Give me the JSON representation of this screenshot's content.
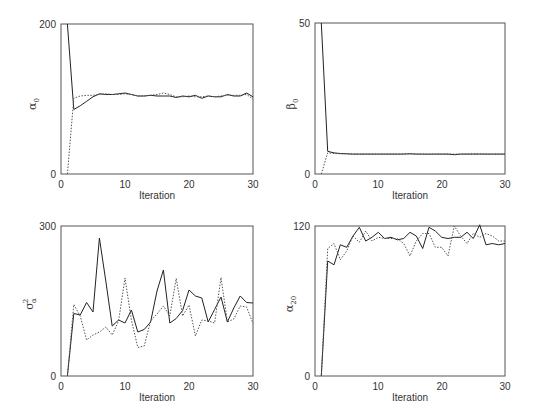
{
  "chart_data": [
    {
      "type": "line",
      "title": "",
      "xlabel": "Iteration",
      "ylabel": "α0",
      "ylabel_main": "α",
      "ylabel_sub": "0",
      "ylabel_sup": "",
      "xlim": [
        0,
        30
      ],
      "ylim": [
        0,
        200
      ],
      "xticks": [
        "0",
        "10",
        "20",
        "30"
      ],
      "yticks": [
        "0",
        "200"
      ],
      "grid": false,
      "x": [
        1,
        2,
        3,
        4,
        5,
        6,
        7,
        8,
        9,
        10,
        11,
        12,
        13,
        14,
        15,
        16,
        17,
        18,
        19,
        20,
        21,
        22,
        23,
        24,
        25,
        26,
        27,
        28,
        29,
        30
      ],
      "series": [
        {
          "name": "chain-solid",
          "style": "solid",
          "values": [
            200,
            86,
            91,
            97,
            103,
            107,
            106,
            106,
            107,
            108,
            106,
            104,
            104,
            105,
            104,
            104,
            104,
            102,
            104,
            103,
            105,
            101,
            104,
            103,
            103,
            106,
            104,
            104,
            108,
            103
          ]
        },
        {
          "name": "chain-dotted",
          "style": "dotted",
          "values": [
            0,
            101,
            104,
            105,
            105,
            106,
            107,
            106,
            106,
            107,
            106,
            104,
            104,
            105,
            106,
            108,
            106,
            103,
            103,
            104,
            103,
            103,
            104,
            103,
            104,
            105,
            105,
            105,
            106,
            100
          ]
        }
      ]
    },
    {
      "type": "line",
      "title": "",
      "xlabel": "Iteration",
      "ylabel": "β0",
      "ylabel_main": "β",
      "ylabel_sub": "0",
      "ylabel_sup": "",
      "xlim": [
        0,
        30
      ],
      "ylim": [
        0,
        50
      ],
      "xticks": [
        "0",
        "10",
        "20",
        "30"
      ],
      "yticks": [
        "0",
        "50"
      ],
      "grid": false,
      "x": [
        1,
        2,
        3,
        4,
        5,
        6,
        7,
        8,
        9,
        10,
        11,
        12,
        13,
        14,
        15,
        16,
        17,
        18,
        19,
        20,
        21,
        22,
        23,
        24,
        25,
        26,
        27,
        28,
        29,
        30
      ],
      "series": [
        {
          "name": "chain-solid",
          "style": "solid",
          "values": [
            50,
            7.5,
            7.0,
            6.8,
            6.7,
            6.6,
            6.6,
            6.6,
            6.6,
            6.6,
            6.6,
            6.6,
            6.6,
            6.6,
            6.7,
            6.6,
            6.6,
            6.6,
            6.6,
            6.6,
            6.6,
            6.4,
            6.6,
            6.6,
            6.6,
            6.6,
            6.6,
            6.6,
            6.6,
            6.6
          ]
        },
        {
          "name": "chain-dotted",
          "style": "dotted",
          "values": [
            0,
            7.0,
            6.8,
            6.7,
            6.7,
            6.6,
            6.6,
            6.6,
            6.6,
            6.6,
            6.6,
            6.6,
            6.6,
            6.7,
            6.7,
            6.6,
            6.6,
            6.5,
            6.6,
            6.6,
            6.6,
            6.6,
            6.6,
            6.6,
            6.7,
            6.7,
            6.6,
            6.6,
            6.6,
            6.6
          ]
        }
      ]
    },
    {
      "type": "line",
      "title": "",
      "xlabel": "Iteration",
      "ylabel": "σ²α",
      "ylabel_main": "σ",
      "ylabel_sub": "α",
      "ylabel_sup": "2",
      "xlim": [
        0,
        30
      ],
      "ylim": [
        0,
        300
      ],
      "xticks": [
        "0",
        "10",
        "20",
        "30"
      ],
      "yticks": [
        "0",
        "300"
      ],
      "grid": false,
      "x": [
        1,
        2,
        3,
        4,
        5,
        6,
        7,
        8,
        9,
        10,
        11,
        12,
        13,
        14,
        15,
        16,
        17,
        18,
        19,
        20,
        21,
        22,
        23,
        24,
        25,
        26,
        27,
        28,
        29,
        30
      ],
      "series": [
        {
          "name": "chain-solid",
          "style": "solid",
          "values": [
            0,
            125,
            122,
            147,
            128,
            276,
            190,
            100,
            112,
            106,
            132,
            88,
            93,
            108,
            170,
            212,
            106,
            115,
            131,
            172,
            160,
            156,
            108,
            133,
            158,
            108,
            136,
            160,
            147,
            146
          ]
        },
        {
          "name": "chain-dotted",
          "style": "dotted",
          "values": [
            0,
            143,
            120,
            72,
            82,
            88,
            98,
            82,
            110,
            196,
            112,
            57,
            60,
            110,
            124,
            140,
            120,
            195,
            120,
            142,
            80,
            112,
            110,
            106,
            197,
            108,
            114,
            140,
            138,
            105
          ]
        }
      ]
    },
    {
      "type": "line",
      "title": "",
      "xlabel": "Iteration",
      "ylabel": "α20",
      "ylabel_main": "α",
      "ylabel_sub": "20",
      "ylabel_sup": "",
      "xlim": [
        0,
        30
      ],
      "ylim": [
        0,
        120
      ],
      "xticks": [
        "0",
        "10",
        "20",
        "30"
      ],
      "yticks": [
        "0",
        "120"
      ],
      "grid": false,
      "x": [
        1,
        2,
        3,
        4,
        5,
        6,
        7,
        8,
        9,
        10,
        11,
        12,
        13,
        14,
        15,
        16,
        17,
        18,
        19,
        20,
        21,
        22,
        23,
        24,
        25,
        26,
        27,
        28,
        29,
        30
      ],
      "series": [
        {
          "name": "chain-solid",
          "style": "solid",
          "values": [
            0,
            92,
            89,
            105,
            103,
            112,
            119,
            108,
            111,
            115,
            110,
            111,
            109,
            110,
            115,
            112,
            102,
            119,
            116,
            111,
            110,
            111,
            111,
            115,
            110,
            121,
            105,
            106,
            105,
            106
          ]
        },
        {
          "name": "chain-dotted",
          "style": "dotted",
          "values": [
            0,
            102,
            106,
            93,
            100,
            112,
            107,
            116,
            108,
            111,
            110,
            110,
            110,
            106,
            96,
            108,
            114,
            114,
            103,
            103,
            96,
            120,
            112,
            106,
            114,
            111,
            114,
            112,
            108,
            108
          ]
        }
      ]
    }
  ]
}
